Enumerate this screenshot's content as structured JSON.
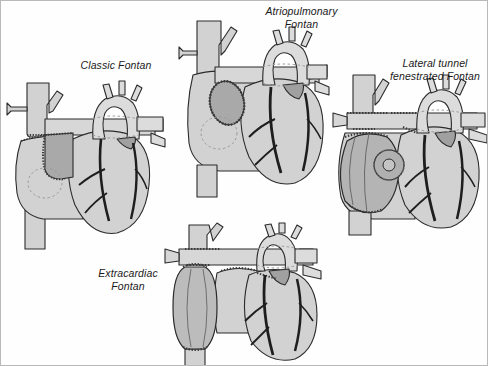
{
  "figure": {
    "title_visible": false,
    "kind": "medical-illustration",
    "border_color": "#b9b9b9",
    "background": "#ffffff"
  },
  "palette": {
    "tissue_fill": "#d2d2d2",
    "tissue_fill_light": "#dcdcdc",
    "conduit_fill": "#a9a9a9",
    "conduit_fill_dark": "#9b9b9b",
    "outline": "#2b2b2b",
    "vessel_dark": "#1e1e1e",
    "suture": "#4a4a4a",
    "hidden_dash": "#8a8a8a",
    "label_color": "#1a1a1a"
  },
  "panels": [
    {
      "id": "classic-fontan",
      "label": "Classic Fontan",
      "label_lines": [
        "Classic Fontan"
      ],
      "label_x": 60,
      "label_y": 58,
      "label_width": 110,
      "description": "Right atrium to pulmonary artery conduit with suture lines; dashed circle marks atrial septal region"
    },
    {
      "id": "atriopulmonary-fontan",
      "label": "Atriopulmonary Fontan",
      "label_lines": [
        "Atriopulmonary",
        "Fontan"
      ],
      "label_x": 248,
      "label_y": 4,
      "label_width": 105,
      "description": "Direct right atrial appendage to pulmonary artery anastomosis shown as stitched oval"
    },
    {
      "id": "lateral-tunnel-fenestrated-fontan",
      "label": "Lateral tunnel fenestrated Fontan",
      "label_lines": [
        "Lateral tunnel",
        "fenestrated Fontan"
      ],
      "label_x": 382,
      "label_y": 56,
      "label_width": 104,
      "description": "Intra-atrial lateral tunnel baffle with a fenestration aperture and bidirectional Glenn"
    },
    {
      "id": "extracardiac-fontan",
      "label": "Extracardiac Fontan",
      "label_lines": [
        "Extracardiac",
        "Fontan"
      ],
      "label_x": 82,
      "label_y": 266,
      "label_width": 90,
      "description": "Extracardiac conduit from inferior vena cava to pulmonary artery outside the heart"
    }
  ]
}
